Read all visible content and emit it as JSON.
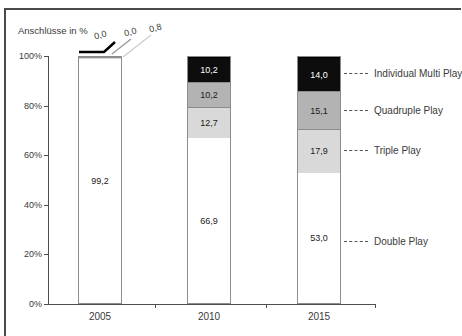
{
  "title": "Anschlüsse in %",
  "colors": {
    "double": "#ffffff",
    "triple": "#d9d9d9",
    "quad": "#b3b3b3",
    "multi": "#0d0d0d",
    "bar_border": "#8c8c8c",
    "axis": "#4d4d4d",
    "text": "#3a3a3a"
  },
  "chart_data": {
    "type": "bar",
    "stacked": true,
    "title": "Anschlüsse in %",
    "categories": [
      "2005",
      "2010",
      "2015"
    ],
    "series": [
      {
        "name": "Double Play",
        "color_key": "double",
        "values": [
          99.2,
          66.9,
          53.0
        ],
        "labels": [
          "99,2",
          "66,9",
          "53,0"
        ]
      },
      {
        "name": "Triple Play",
        "color_key": "triple",
        "values": [
          0.8,
          12.7,
          17.9
        ],
        "labels": [
          "0,8",
          "12,7",
          "17,9"
        ]
      },
      {
        "name": "Quadruple Play",
        "color_key": "quad",
        "values": [
          0.0,
          10.2,
          15.1
        ],
        "labels": [
          "0,0",
          "10,2",
          "15,1"
        ]
      },
      {
        "name": "Individual Multi Play",
        "color_key": "multi",
        "values": [
          0.0,
          10.2,
          14.0
        ],
        "labels": [
          "0,0",
          "10,2",
          "14,0"
        ]
      }
    ],
    "ylabel": "Anschlüsse in %",
    "ylim": [
      0,
      100
    ],
    "yticks": [
      "100%",
      "80%",
      "60%",
      "40%",
      "20%",
      "0%"
    ],
    "grid": false,
    "legend_position": "right-annotations"
  },
  "annotations": {
    "right_labels": [
      "Individual Multi Play",
      "Quadruple Play",
      "Triple Play",
      "Double Play"
    ],
    "callout_labels_2005": [
      "0,0",
      "0,0",
      "0,8"
    ]
  }
}
